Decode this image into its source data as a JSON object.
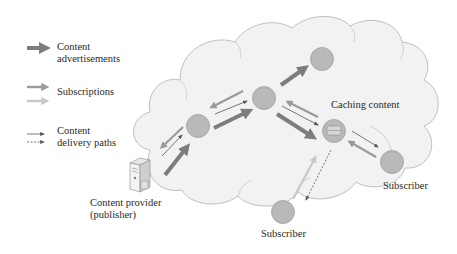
{
  "legend": {
    "items": [
      {
        "id": "adv",
        "label_lines": [
          "Content",
          "advertisements"
        ],
        "style": "thick-dark-arrow"
      },
      {
        "id": "sub",
        "label_lines": [
          "Subscriptions"
        ],
        "style": "medium-gray-arrows"
      },
      {
        "id": "del",
        "label_lines": [
          "Content",
          "delivery paths"
        ],
        "style": "thin-solid-and-dashed-arrows"
      }
    ]
  },
  "labels": {
    "caching_content": "Caching content",
    "subscriber_right": "Subscriber",
    "subscriber_bottom": "Subscriber",
    "provider_line1": "Content provider",
    "provider_line2": "(publisher)"
  },
  "colors": {
    "cloud_fill": "#f2f2f2",
    "cloud_stroke": "#b8b8b8",
    "node_fill": "#b9b9b9",
    "node_stroke": "#a0a0a0",
    "adv_arrow": "#7d7d7d",
    "sub_arrow_dark": "#9a9a9a",
    "sub_arrow_light": "#c8c8c8",
    "delivery_arrow": "#666666",
    "text": "#2a2a2a"
  },
  "nodes": [
    {
      "id": "n1",
      "role": "router"
    },
    {
      "id": "n2",
      "role": "router"
    },
    {
      "id": "n3",
      "role": "router"
    },
    {
      "id": "cache",
      "role": "caching-router"
    },
    {
      "id": "subR",
      "role": "subscriber"
    },
    {
      "id": "subB",
      "role": "subscriber"
    }
  ]
}
